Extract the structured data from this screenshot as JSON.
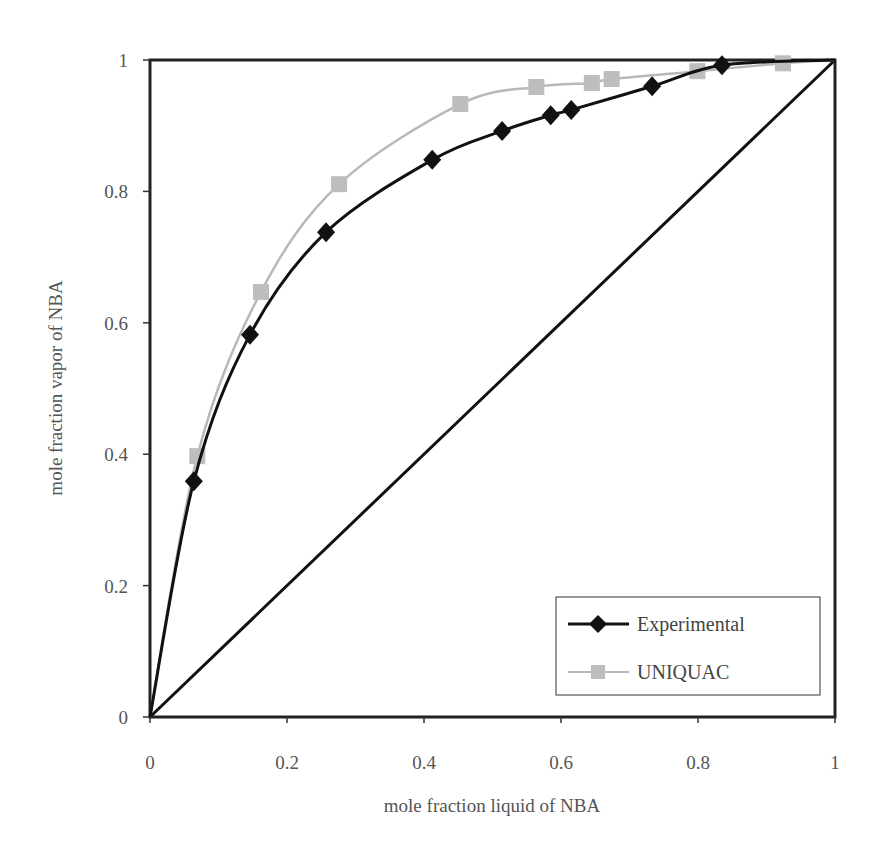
{
  "chart_data": {
    "type": "line",
    "title": "",
    "xlabel": "mole fraction liquid of NBA",
    "ylabel": "mole fraction vapor of NBA",
    "xlim": [
      0,
      1
    ],
    "ylim": [
      0,
      1
    ],
    "grid": false,
    "legend_position": "lower right (inside plot)",
    "x_ticks": [
      "0",
      "0.2",
      "0.4",
      "0.6",
      "0.8",
      "1"
    ],
    "y_ticks": [
      "0",
      "0.2",
      "0.4",
      "0.6",
      "0.8",
      "1"
    ],
    "series": [
      {
        "name": "Experimental",
        "color": "#111111",
        "marker": "diamond",
        "points": [
          [
            0,
            0
          ],
          [
            0.064,
            0.359
          ],
          [
            0.146,
            0.582
          ],
          [
            0.257,
            0.738
          ],
          [
            0.412,
            0.848
          ],
          [
            0.514,
            0.892
          ],
          [
            0.585,
            0.916
          ],
          [
            0.615,
            0.924
          ],
          [
            0.733,
            0.96
          ],
          [
            0.835,
            0.992
          ],
          [
            1,
            1
          ]
        ]
      },
      {
        "name": "UNIQUAC",
        "color": "#b8b8b8",
        "marker": "square",
        "points": [
          [
            0,
            0
          ],
          [
            0.069,
            0.397
          ],
          [
            0.162,
            0.647
          ],
          [
            0.276,
            0.811
          ],
          [
            0.453,
            0.933
          ],
          [
            0.564,
            0.959
          ],
          [
            0.645,
            0.965
          ],
          [
            0.674,
            0.971
          ],
          [
            0.799,
            0.983
          ],
          [
            0.924,
            0.995
          ],
          [
            1,
            1
          ]
        ]
      },
      {
        "name": "x = y diagonal",
        "color": "#111111",
        "marker": "none",
        "points": [
          [
            0,
            0
          ],
          [
            1,
            1
          ]
        ]
      }
    ],
    "legend": [
      "Experimental",
      "UNIQUAC"
    ]
  }
}
